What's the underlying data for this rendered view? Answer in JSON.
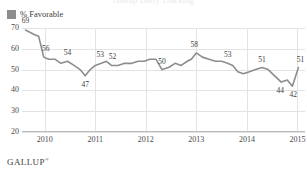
{
  "header": {
    "title_cutoff": "Gallup Daily Tracking"
  },
  "legend": {
    "position": "top-left",
    "swatch_color": "#8d8d8d",
    "items": [
      {
        "label": "% Favorable",
        "icon": "square-swatch"
      }
    ]
  },
  "footer": {
    "brand": "GALLUP",
    "trademark": "®"
  },
  "chart_data": {
    "type": "line",
    "title": "",
    "subtitle": "",
    "xlabel": "",
    "ylabel": "",
    "ylim": [
      20,
      70
    ],
    "yticks": [
      20,
      30,
      40,
      50,
      60,
      70
    ],
    "xticks": [
      "2010",
      "2011",
      "2012",
      "2013",
      "2014",
      "2015"
    ],
    "xlim": [
      2009.55,
      2015.15
    ],
    "grid": true,
    "legend_position": "top-left",
    "line_color": "#8d8d8d",
    "series": [
      {
        "name": "% Favorable",
        "x": [
          2009.62,
          2009.78,
          2009.88,
          2009.98,
          2010.08,
          2010.2,
          2010.32,
          2010.45,
          2010.58,
          2010.7,
          2010.8,
          2010.9,
          2011.0,
          2011.12,
          2011.22,
          2011.32,
          2011.45,
          2011.58,
          2011.72,
          2011.85,
          2011.97,
          2012.08,
          2012.2,
          2012.32,
          2012.45,
          2012.58,
          2012.7,
          2012.82,
          2012.9,
          2013.0,
          2013.12,
          2013.25,
          2013.38,
          2013.5,
          2013.62,
          2013.72,
          2013.82,
          2013.93,
          2014.05,
          2014.17,
          2014.3,
          2014.42,
          2014.55,
          2014.68,
          2014.8,
          2014.9,
          2015.02
        ],
        "values": [
          69,
          67,
          66,
          56,
          55,
          55,
          53,
          54,
          52,
          50,
          47,
          50,
          52,
          53,
          54,
          52,
          52,
          53,
          53,
          54,
          54,
          55,
          55,
          50,
          51,
          53,
          52,
          54,
          55,
          58,
          56,
          55,
          54,
          54,
          53,
          52,
          49,
          48,
          49,
          50,
          51,
          50,
          47,
          44,
          45,
          42,
          51
        ]
      }
    ],
    "point_labels": [
      {
        "value": 69,
        "x": 2009.62,
        "y": 69,
        "dx": 0,
        "dy": -9
      },
      {
        "value": 56,
        "x": 2009.98,
        "y": 56,
        "dx": 2,
        "dy": -8
      },
      {
        "value": 54,
        "x": 2010.45,
        "y": 54,
        "dx": 0,
        "dy": -8
      },
      {
        "value": 47,
        "x": 2010.8,
        "y": 47,
        "dx": 0,
        "dy": 9
      },
      {
        "value": 53,
        "x": 2011.12,
        "y": 53,
        "dx": -1,
        "dy": -8
      },
      {
        "value": 52,
        "x": 2011.32,
        "y": 52,
        "dx": 1,
        "dy": -8
      },
      {
        "value": 50,
        "x": 2012.32,
        "y": 50,
        "dx": 0,
        "dy": -8
      },
      {
        "value": 58,
        "x": 2013.0,
        "y": 58,
        "dx": -2,
        "dy": -8
      },
      {
        "value": 53,
        "x": 2013.62,
        "y": 53,
        "dx": 0,
        "dy": -8
      },
      {
        "value": 51,
        "x": 2014.3,
        "y": 51,
        "dx": 0,
        "dy": -8
      },
      {
        "value": 44,
        "x": 2014.68,
        "y": 44,
        "dx": -1,
        "dy": 9
      },
      {
        "value": 42,
        "x": 2014.9,
        "y": 42,
        "dx": 1,
        "dy": 9
      },
      {
        "value": 51,
        "x": 2015.02,
        "y": 51,
        "dx": 2,
        "dy": -8
      }
    ]
  }
}
